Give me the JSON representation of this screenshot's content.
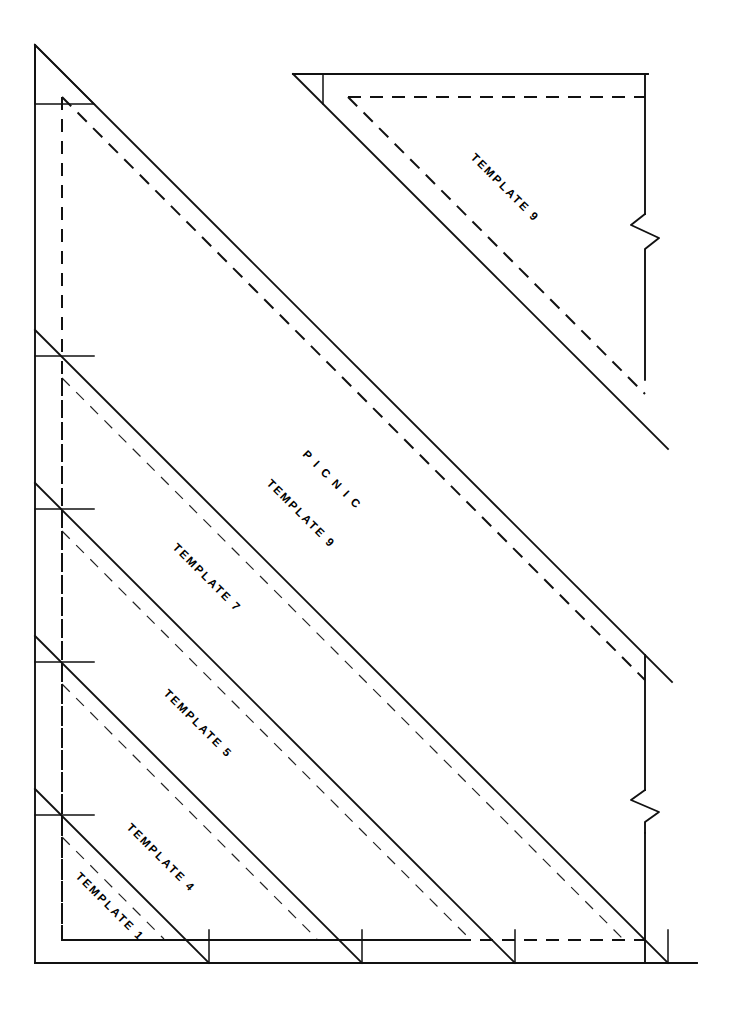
{
  "document": {
    "title": "PICNIC quilt template sheet",
    "background_color": "#ffffff",
    "ink_color": "#111111",
    "width": 731,
    "height": 1032
  },
  "labels": {
    "picnic": "P I C N I C",
    "picnic_template_9": "TEMPLATE 9",
    "template_9_top": "TEMPLATE 9",
    "template_7": "TEMPLATE 7",
    "template_5": "TEMPLATE 5",
    "template_4": "TEMPLATE 4",
    "template_1": "TEMPLATE 1"
  },
  "templates": [
    {
      "name": "TEMPLATE 1",
      "label_x": 112,
      "label_y": 872,
      "rotation": 45
    },
    {
      "name": "TEMPLATE 4",
      "label_x": 128,
      "label_y": 823,
      "rotation": 45
    },
    {
      "name": "TEMPLATE 5",
      "label_x": 162,
      "label_y": 690,
      "rotation": 45
    },
    {
      "name": "TEMPLATE 7",
      "label_x": 173,
      "label_y": 545,
      "rotation": 45
    },
    {
      "name": "TEMPLATE 9",
      "label_x": 272,
      "label_y": 487,
      "rotation": 45
    },
    {
      "name": "TEMPLATE 9",
      "label_x": 470,
      "label_y": 158,
      "rotation": 45
    }
  ],
  "geometry": {
    "note": "Nested right triangles sharing lower-left origin; solid lines are cutting lines, dashed lines are seam (stitching) lines.",
    "origin_x": 35,
    "origin_y": 963,
    "apex_x": 35,
    "apex_y": 45,
    "right_x": 697,
    "break_symbol_count": 2
  }
}
